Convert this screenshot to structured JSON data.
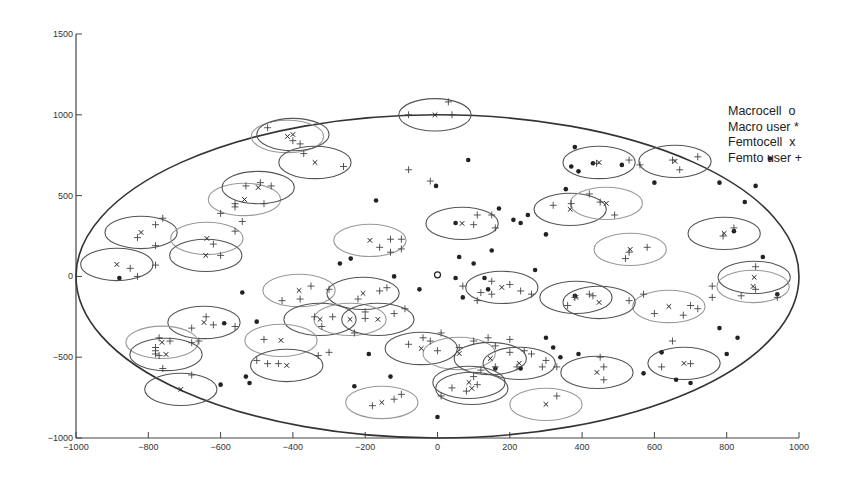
{
  "chart_data": {
    "type": "scatter",
    "title": "",
    "xlabel": "",
    "ylabel": "",
    "xlim": [
      -1000,
      1000
    ],
    "ylim": [
      -1000,
      1500
    ],
    "xticks": [
      -1000,
      -800,
      -600,
      -400,
      -200,
      0,
      200,
      400,
      600,
      800,
      1000
    ],
    "yticks": [
      -1000,
      -500,
      0,
      500,
      1000,
      1500
    ],
    "grid": false,
    "legend_position": "upper right (outside boundary)",
    "legend": [
      {
        "label": "Macrocell",
        "marker": "o"
      },
      {
        "label": "Macro user",
        "marker": "*"
      },
      {
        "label": "Femtocell",
        "marker": "x"
      },
      {
        "label": "Femto user",
        "marker": "+"
      }
    ],
    "macrocell_coverage_radius": 1000,
    "femtocell_coverage_radius": 100,
    "series": [
      {
        "name": "Macrocell",
        "marker": "o",
        "points": [
          [
            0,
            10
          ]
        ]
      },
      {
        "name": "Femtocell",
        "marker": "x",
        "points": [
          [
            -7,
            1000
          ],
          [
            -415,
            866
          ],
          [
            -400,
            878
          ],
          [
            -339,
            705
          ],
          [
            -534,
            476
          ],
          [
            -496,
            550
          ],
          [
            -820,
            272
          ],
          [
            -638,
            235
          ],
          [
            -641,
            130
          ],
          [
            -887,
            74
          ],
          [
            -187,
            223
          ],
          [
            68,
            328
          ],
          [
            367,
            415
          ],
          [
            467,
            452
          ],
          [
            447,
            705
          ],
          [
            657,
            712
          ],
          [
            533,
            167
          ],
          [
            793,
            266
          ],
          [
            876,
            -6
          ],
          [
            873,
            -62
          ],
          [
            383,
            -130
          ],
          [
            178,
            -68
          ],
          [
            -383,
            -87
          ],
          [
            -206,
            -105
          ],
          [
            -325,
            -266
          ],
          [
            -242,
            -266
          ],
          [
            -165,
            -266
          ],
          [
            -646,
            -285
          ],
          [
            -762,
            -408
          ],
          [
            -751,
            -483
          ],
          [
            -45,
            -446
          ],
          [
            60,
            -477
          ],
          [
            146,
            -508
          ],
          [
            226,
            -538
          ],
          [
            -433,
            -396
          ],
          [
            -417,
            -551
          ],
          [
            -710,
            -699
          ],
          [
            -154,
            -780
          ],
          [
            87,
            -656
          ],
          [
            95,
            -693
          ],
          [
            300,
            -792
          ],
          [
            441,
            -594
          ],
          [
            682,
            -538
          ],
          [
            640,
            -186
          ],
          [
            447,
            -161
          ]
        ]
      },
      {
        "name": "Macro user",
        "marker": "*",
        "points": [
          [
            -880,
            -10
          ],
          [
            -540,
            -100
          ],
          [
            -590,
            -290
          ],
          [
            -500,
            -280
          ],
          [
            -530,
            -620
          ],
          [
            -520,
            -660
          ],
          [
            -600,
            -670
          ],
          [
            -230,
            -680
          ],
          [
            -270,
            80
          ],
          [
            -240,
            110
          ],
          [
            -170,
            470
          ],
          [
            -120,
            0
          ],
          [
            -50,
            -80
          ],
          [
            50,
            -10
          ],
          [
            70,
            -130
          ],
          [
            140,
            -80
          ],
          [
            130,
            -10
          ],
          [
            85,
            720
          ],
          [
            100,
            80
          ],
          [
            170,
            420
          ],
          [
            210,
            350
          ],
          [
            -4,
            560
          ],
          [
            250,
            380
          ],
          [
            270,
            40
          ],
          [
            60,
            120
          ],
          [
            230,
            330
          ],
          [
            50,
            330
          ],
          [
            150,
            160
          ],
          [
            380,
            800
          ],
          [
            390,
            650
          ],
          [
            430,
            700
          ],
          [
            300,
            260
          ],
          [
            355,
            540
          ],
          [
            370,
            680
          ],
          [
            510,
            690
          ],
          [
            600,
            580
          ],
          [
            160,
            -570
          ],
          [
            230,
            -570
          ],
          [
            300,
            -380
          ],
          [
            320,
            -440
          ],
          [
            340,
            -500
          ],
          [
            390,
            -480
          ],
          [
            -190,
            -480
          ],
          [
            -130,
            -620
          ],
          [
            0,
            -870
          ],
          [
            570,
            -600
          ],
          [
            620,
            -470
          ],
          [
            660,
            -640
          ],
          [
            780,
            -320
          ],
          [
            800,
            -480
          ],
          [
            830,
            -380
          ],
          [
            820,
            280
          ],
          [
            850,
            460
          ],
          [
            880,
            560
          ],
          [
            900,
            120
          ],
          [
            940,
            -110
          ],
          [
            780,
            580
          ],
          [
            920,
            730
          ],
          [
            700,
            -660
          ],
          [
            380,
            -120
          ]
        ]
      },
      {
        "name": "Femto user",
        "marker": "+",
        "points": [
          [
            30,
            1080
          ],
          [
            40,
            1000
          ],
          [
            -80,
            1000
          ],
          [
            -470,
            920
          ],
          [
            -400,
            840
          ],
          [
            -380,
            820
          ],
          [
            -370,
            760
          ],
          [
            -260,
            680
          ],
          [
            -490,
            580
          ],
          [
            -530,
            560
          ],
          [
            -460,
            560
          ],
          [
            -560,
            450
          ],
          [
            -560,
            430
          ],
          [
            -480,
            450
          ],
          [
            -600,
            390
          ],
          [
            -830,
            240
          ],
          [
            -780,
            320
          ],
          [
            -760,
            360
          ],
          [
            -780,
            190
          ],
          [
            -560,
            280
          ],
          [
            -540,
            340
          ],
          [
            -620,
            200
          ],
          [
            -600,
            130
          ],
          [
            -850,
            50
          ],
          [
            -830,
            0
          ],
          [
            -780,
            70
          ],
          [
            -160,
            180
          ],
          [
            -130,
            150
          ],
          [
            -100,
            170
          ],
          [
            -100,
            230
          ],
          [
            -130,
            230
          ],
          [
            110,
            380
          ],
          [
            150,
            380
          ],
          [
            100,
            320
          ],
          [
            160,
            300
          ],
          [
            370,
            450
          ],
          [
            420,
            510
          ],
          [
            320,
            440
          ],
          [
            490,
            380
          ],
          [
            450,
            460
          ],
          [
            440,
            700
          ],
          [
            560,
            690
          ],
          [
            530,
            720
          ],
          [
            650,
            720
          ],
          [
            670,
            660
          ],
          [
            720,
            740
          ],
          [
            530,
            150
          ],
          [
            580,
            180
          ],
          [
            520,
            110
          ],
          [
            790,
            250
          ],
          [
            820,
            300
          ],
          [
            760,
            -60
          ],
          [
            760,
            -130
          ],
          [
            840,
            -120
          ],
          [
            880,
            60
          ],
          [
            940,
            -130
          ],
          [
            880,
            -80
          ],
          [
            360,
            -180
          ],
          [
            380,
            -130
          ],
          [
            430,
            -120
          ],
          [
            420,
            -110
          ],
          [
            530,
            -150
          ],
          [
            570,
            -110
          ],
          [
            150,
            -110
          ],
          [
            200,
            -50
          ],
          [
            150,
            -30
          ],
          [
            120,
            -100
          ],
          [
            110,
            -150
          ],
          [
            230,
            -90
          ],
          [
            260,
            -110
          ],
          [
            70,
            -60
          ],
          [
            -380,
            -140
          ],
          [
            -430,
            -150
          ],
          [
            -350,
            -60
          ],
          [
            -300,
            -80
          ],
          [
            -220,
            -140
          ],
          [
            -140,
            -70
          ],
          [
            -160,
            -90
          ],
          [
            -230,
            -350
          ],
          [
            -320,
            -310
          ],
          [
            -290,
            -250
          ],
          [
            -340,
            -250
          ],
          [
            -200,
            -220
          ],
          [
            -200,
            -260
          ],
          [
            -120,
            -230
          ],
          [
            -90,
            -200
          ],
          [
            -640,
            -250
          ],
          [
            -620,
            -300
          ],
          [
            -560,
            -310
          ],
          [
            -680,
            -320
          ],
          [
            -770,
            -380
          ],
          [
            -740,
            -400
          ],
          [
            -780,
            -440
          ],
          [
            -780,
            -460
          ],
          [
            -770,
            -490
          ],
          [
            -760,
            -570
          ],
          [
            -680,
            -410
          ],
          [
            -660,
            -400
          ],
          [
            -480,
            -390
          ],
          [
            -470,
            -540
          ],
          [
            -440,
            -540
          ],
          [
            -300,
            -470
          ],
          [
            -330,
            -490
          ],
          [
            -500,
            -520
          ],
          [
            -680,
            -610
          ],
          [
            -780,
            -480
          ],
          [
            -80,
            -420
          ],
          [
            -40,
            -380
          ],
          [
            -20,
            -400
          ],
          [
            10,
            -350
          ],
          [
            60,
            -440
          ],
          [
            100,
            -400
          ],
          [
            140,
            -380
          ],
          [
            160,
            -430
          ],
          [
            200,
            -390
          ],
          [
            240,
            -460
          ],
          [
            260,
            -480
          ],
          [
            300,
            -520
          ],
          [
            330,
            -560
          ],
          [
            160,
            -560
          ],
          [
            200,
            -470
          ],
          [
            0,
            -460
          ],
          [
            100,
            -620
          ],
          [
            120,
            -580
          ],
          [
            110,
            -670
          ],
          [
            80,
            -710
          ],
          [
            40,
            -690
          ],
          [
            10,
            -740
          ],
          [
            220,
            -560
          ],
          [
            290,
            -560
          ],
          [
            330,
            -740
          ],
          [
            460,
            -640
          ],
          [
            460,
            -560
          ],
          [
            450,
            -500
          ],
          [
            620,
            -560
          ],
          [
            700,
            -540
          ],
          [
            650,
            -400
          ],
          [
            600,
            -230
          ],
          [
            680,
            -240
          ],
          [
            700,
            -180
          ],
          [
            720,
            -200
          ],
          [
            -180,
            -800
          ],
          [
            -120,
            -760
          ],
          [
            -100,
            -730
          ],
          [
            -80,
            660
          ],
          [
            -20,
            590
          ]
        ]
      }
    ]
  },
  "legend": {
    "items": [
      {
        "label": "Macrocell  o"
      },
      {
        "label": "Macro user *"
      },
      {
        "label": "Femtocell  x"
      },
      {
        "label": "Femto user +"
      }
    ]
  }
}
